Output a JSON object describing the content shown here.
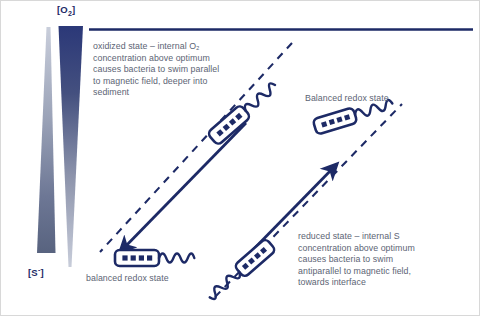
{
  "figure": {
    "colors": {
      "ink": "#1d2a66",
      "text": "#5c6474",
      "o2_top": "#2c3a78",
      "o2_bottom": "#c9cedb",
      "s_top": "#c9cedb",
      "s_bottom": "#5a6480",
      "background": "#ffffff"
    }
  },
  "gradients": {
    "oxygen": {
      "label": "[O",
      "label_sub": "2",
      "label_end": "]",
      "label_full": "[O2]",
      "description": "oxygen concentration gradient, high at top interface decreasing downward"
    },
    "sulfide": {
      "label": "[S",
      "label_sup": "-",
      "label_end": "]",
      "label_full": "[S-]",
      "description": "sulfide concentration gradient, low at top increasing downward"
    }
  },
  "captions": {
    "oxidized": "oxidized state – internal O₂ concentration above optimum causes bacteria to swim parallel to magnetic field, deeper into sediment",
    "reduced": "reduced state – internal S concentration above optimum causes bacteria to swim antiparallel to magnetic field, towards interface",
    "balanced_top": "Balanced redox state",
    "balanced_bottom": "balanced redox state"
  },
  "elements": {
    "interface_line": "oxic-anoxic interface",
    "field_line_left": "magnetic field line (dashed)",
    "field_line_right": "magnetic field line (dashed)",
    "arrow_down_left": "swim direction parallel to field, downward into sediment",
    "arrow_up_right": "swim direction antiparallel to field, upward towards interface",
    "bacteria_count": 4
  }
}
